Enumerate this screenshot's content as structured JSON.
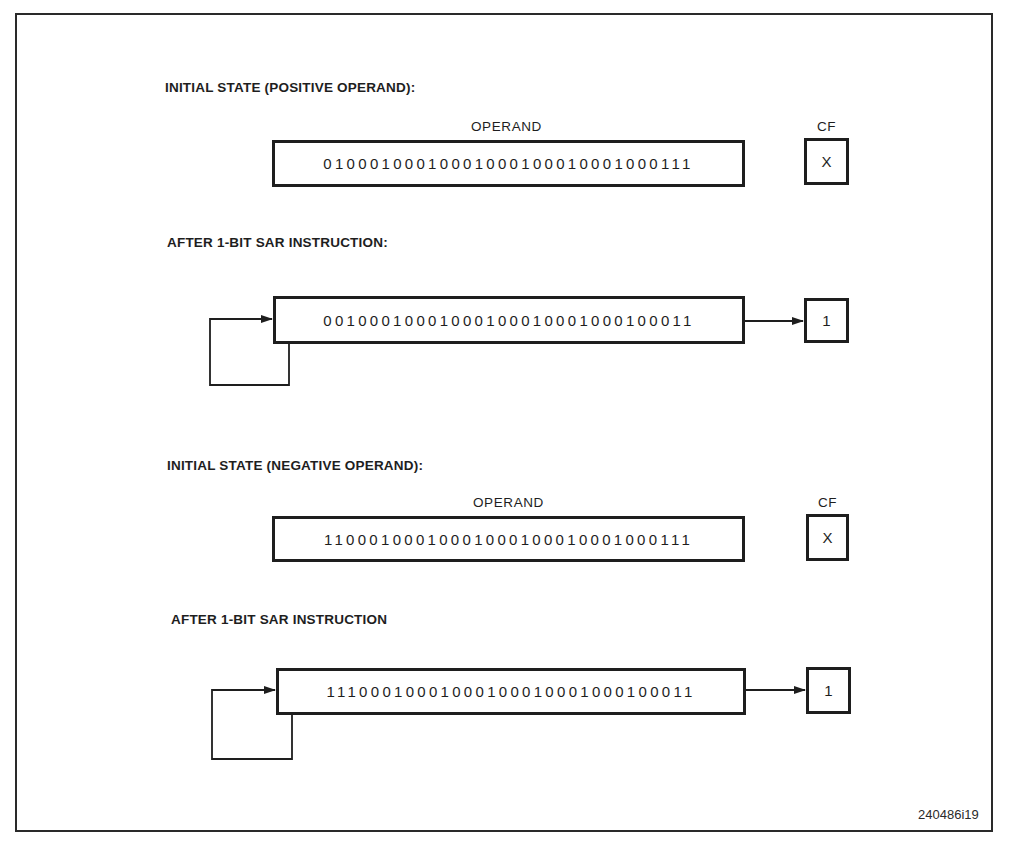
{
  "figure": {
    "id_label": "240486i19"
  },
  "sections": [
    {
      "title": "INITIAL STATE (POSITIVE OPERAND):",
      "operand_header": "OPERAND",
      "cf_header": "CF",
      "operand_bits": "01000100010001000100010001000111",
      "cf_value": "X"
    },
    {
      "title": "AFTER 1-BIT SAR INSTRUCTION:",
      "operand_bits": "00100010001000100010001000100011",
      "cf_value": "1"
    },
    {
      "title": "INITIAL STATE (NEGATIVE OPERAND):",
      "operand_header": "OPERAND",
      "cf_header": "CF",
      "operand_bits": "11000100010001000100010001000111",
      "cf_value": "X"
    },
    {
      "title": "AFTER 1-BIT SAR INSTRUCTION",
      "operand_bits": "11100010001000100010001000100011",
      "cf_value": "1"
    }
  ],
  "icons": {
    "arrow": "arrow-right-icon",
    "sign_feedback_loop": "loop-arrow-icon"
  },
  "colors": {
    "ink": "#1e1e1e",
    "background": "#ffffff"
  }
}
